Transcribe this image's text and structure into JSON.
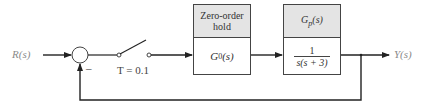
{
  "diagram": {
    "type": "sampled-data feedback control block diagram",
    "input": {
      "label": "R(s)"
    },
    "output": {
      "label": "Y(s)"
    },
    "summing_junction": {
      "feedback_sign": "–"
    },
    "sampler": {
      "label": "T = 0.1"
    },
    "blocks": [
      {
        "header": "Zero-order hold",
        "header_line1": "Zero-order",
        "header_line2": "hold",
        "body": "G0(s)",
        "body_main": "G",
        "body_sub": "0",
        "body_arg": "(s)"
      },
      {
        "header": "Gp(s)",
        "header_main": "G",
        "header_sub": "p",
        "header_arg": "(s)",
        "body": "1 / s(s + 3)",
        "numerator": "1",
        "denominator": "s(s + 3)"
      }
    ],
    "colors": {
      "line": "#222222",
      "header_fill": "#e4e4e4",
      "label_gray": "#8a8a8a"
    }
  }
}
